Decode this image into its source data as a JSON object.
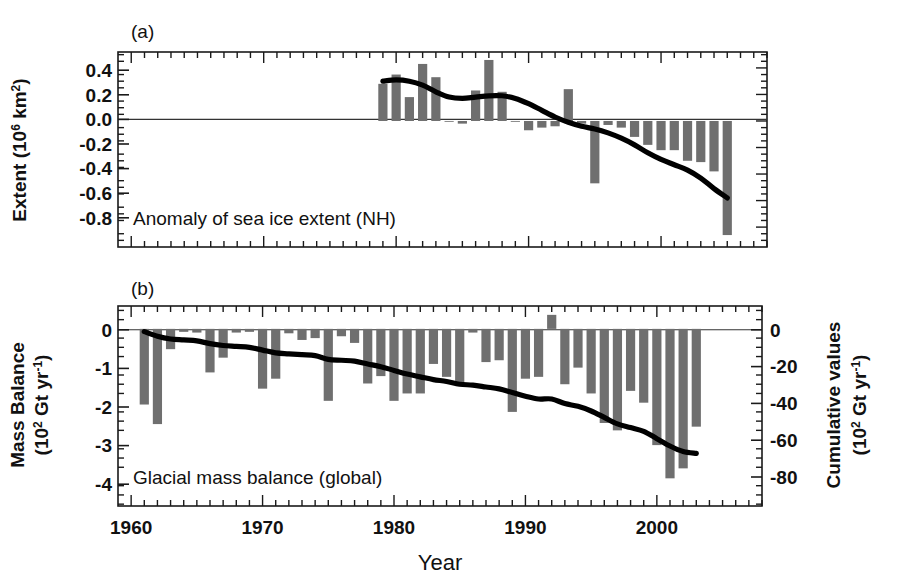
{
  "figure": {
    "xlabel": "Year",
    "x_ticks": [
      1960,
      1970,
      1980,
      1990,
      2000
    ],
    "x_tick_labels": [
      "1960",
      "1970",
      "1980",
      "1990",
      "2000"
    ],
    "xlim": [
      1959,
      2008
    ],
    "bar_color": "#6f6f6f",
    "line_color": "#000000",
    "background": "#ffffff"
  },
  "chart_data": [
    {
      "type": "bar",
      "panel": "a",
      "panel_letter": "(a)",
      "title": "Anomaly of sea ice extent (NH)",
      "xlabel": "Year",
      "ylabel": "Extent (10⁶ km²)",
      "ylabel_main": "Extent",
      "ylabel_units": "(10  km )",
      "ylabel_exp1": "6",
      "ylabel_exp2": "2",
      "ylim": [
        -0.95,
        0.52
      ],
      "xlim": [
        1959,
        2008
      ],
      "yticks": [
        0.4,
        0.2,
        0.0,
        -0.2,
        -0.4,
        -0.6,
        -0.8
      ],
      "ytick_labels": [
        "0.4",
        "0.2",
        "0.0",
        "-0.2",
        "-0.4",
        "-0.6",
        "-0.8"
      ],
      "grid": false,
      "legend": "none",
      "categories": [
        1979,
        1980,
        1981,
        1982,
        1983,
        1984,
        1985,
        1986,
        1987,
        1988,
        1989,
        1990,
        1991,
        1992,
        1993,
        1994,
        1995,
        1996,
        1997,
        1998,
        1999,
        2000,
        2001,
        2002,
        2003,
        2004,
        2005
      ],
      "values": [
        0.28,
        0.35,
        0.18,
        0.43,
        0.33,
        0.0,
        -0.02,
        0.23,
        0.46,
        0.22,
        0.0,
        -0.07,
        -0.05,
        -0.04,
        0.24,
        -0.02,
        -0.47,
        -0.03,
        -0.05,
        -0.12,
        -0.18,
        -0.22,
        -0.22,
        -0.3,
        -0.31,
        -0.38,
        -0.86
      ],
      "series": [
        {
          "name": "smoothed trend",
          "type": "line",
          "x": [
            1979,
            1980,
            1981,
            1982,
            1983,
            1984,
            1985,
            1986,
            1987,
            1988,
            1989,
            1990,
            1991,
            1992,
            1993,
            1994,
            1995,
            1996,
            1997,
            1998,
            1999,
            2000,
            2001,
            2002,
            2003,
            2004,
            2005
          ],
          "values": [
            0.3,
            0.31,
            0.3,
            0.27,
            0.22,
            0.18,
            0.17,
            0.18,
            0.19,
            0.19,
            0.17,
            0.13,
            0.08,
            0.03,
            -0.01,
            -0.04,
            -0.06,
            -0.09,
            -0.13,
            -0.18,
            -0.24,
            -0.29,
            -0.33,
            -0.37,
            -0.43,
            -0.51,
            -0.58
          ]
        }
      ]
    },
    {
      "type": "bar",
      "panel": "b",
      "panel_letter": "(b)",
      "title": "Glacial mass balance (global)",
      "xlabel": "Year",
      "ylabel": "Mass Balance (10² Gt yr⁻¹)",
      "ylabel_main": "Mass Balance",
      "ylabel_units": "(10  Gt yr  )",
      "ylabel_exp1": "2",
      "ylabel_exp2": "-1",
      "y2label": "Cumulative values (10² Gt yr⁻¹)",
      "y2label_main": "Cumulative values",
      "y2label_units": "(10  Gt yr  )",
      "y2label_exp1": "2",
      "y2label_exp2": "-1",
      "ylim": [
        -4.8,
        0.62
      ],
      "xlim": [
        1959,
        2008
      ],
      "yticks": [
        0,
        -1,
        -2,
        -3,
        -4
      ],
      "ytick_labels": [
        "0",
        "-1",
        "-2",
        "-3",
        "-4"
      ],
      "y2lim": [
        -96,
        12.4
      ],
      "y2ticks": [
        0,
        -20,
        -40,
        -60,
        -80
      ],
      "y2tick_labels": [
        "0",
        "-20",
        "-40",
        "-60",
        "-80"
      ],
      "grid": false,
      "legend": "none",
      "categories": [
        1961,
        1962,
        1963,
        1964,
        1965,
        1966,
        1967,
        1968,
        1969,
        1970,
        1971,
        1972,
        1973,
        1974,
        1975,
        1976,
        1977,
        1978,
        1979,
        1980,
        1981,
        1982,
        1983,
        1984,
        1985,
        1986,
        1987,
        1988,
        1989,
        1990,
        1991,
        1992,
        1993,
        1994,
        1995,
        1996,
        1997,
        1998,
        1999,
        2000,
        2001,
        2002,
        2003
      ],
      "values": [
        -2.05,
        -2.58,
        -0.55,
        -0.08,
        -0.1,
        -1.18,
        -0.78,
        -0.1,
        -0.08,
        -1.62,
        -1.35,
        -0.12,
        -0.3,
        -0.25,
        -1.95,
        -0.2,
        -0.38,
        -1.48,
        -1.28,
        -1.95,
        -1.75,
        -1.75,
        -0.95,
        -1.3,
        -1.55,
        -0.1,
        -0.9,
        -0.85,
        -2.25,
        -1.35,
        -1.3,
        0.38,
        -1.5,
        -1.05,
        -1.75,
        -2.55,
        -2.75,
        -1.68,
        -2.0,
        -3.15,
        -4.05,
        -3.78,
        -2.65
      ],
      "series": [
        {
          "name": "cumulative values",
          "type": "line",
          "x": [
            1961,
            1962,
            1963,
            1964,
            1965,
            1966,
            1967,
            1968,
            1969,
            1970,
            1971,
            1972,
            1973,
            1974,
            1975,
            1976,
            1977,
            1978,
            1979,
            1980,
            1981,
            1982,
            1983,
            1984,
            1985,
            1986,
            1987,
            1988,
            1989,
            1990,
            1991,
            1992,
            1993,
            1994,
            1995,
            1996,
            1997,
            1998,
            1999,
            2000,
            2001,
            2002,
            2003
          ],
          "values_secondary": [
            -1.5,
            -4.0,
            -5.5,
            -6.0,
            -6.5,
            -8.0,
            -9.0,
            -9.5,
            -10.0,
            -11.5,
            -13.0,
            -13.5,
            -14.0,
            -14.5,
            -16.5,
            -17.0,
            -17.5,
            -19.0,
            -20.5,
            -22.5,
            -24.5,
            -26.0,
            -27.5,
            -28.5,
            -30.0,
            -30.5,
            -31.5,
            -32.5,
            -34.5,
            -36.5,
            -38.0,
            -38.0,
            -40.5,
            -42.0,
            -44.5,
            -48.0,
            -51.5,
            -53.5,
            -55.5,
            -59.5,
            -63.5,
            -66.5,
            -67.5
          ]
        }
      ]
    }
  ]
}
